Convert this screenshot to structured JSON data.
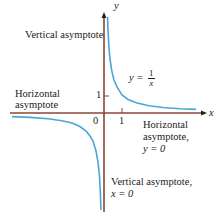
{
  "figure": {
    "function_label": {
      "prefix": "y =",
      "numerator": "1",
      "denominator": "x"
    },
    "axes": {
      "x_label": "x",
      "y_label": "y",
      "origin_label": "0",
      "x_tick_label": "1",
      "y_tick_label": "1"
    },
    "annotations": {
      "vertical_top": "Vertical asymptote",
      "horizontal_left_line1": "Horizontal",
      "horizontal_left_line2": "asymptote",
      "horizontal_right_line1": "Horizontal",
      "horizontal_right_line2": "asymptote,",
      "horizontal_right_line3": "y = 0",
      "vertical_bottom_line1": "Vertical asymptote,",
      "vertical_bottom_line2": "x = 0"
    },
    "colors": {
      "axis": "#8b4536",
      "curve": "#4aa6d6"
    }
  }
}
